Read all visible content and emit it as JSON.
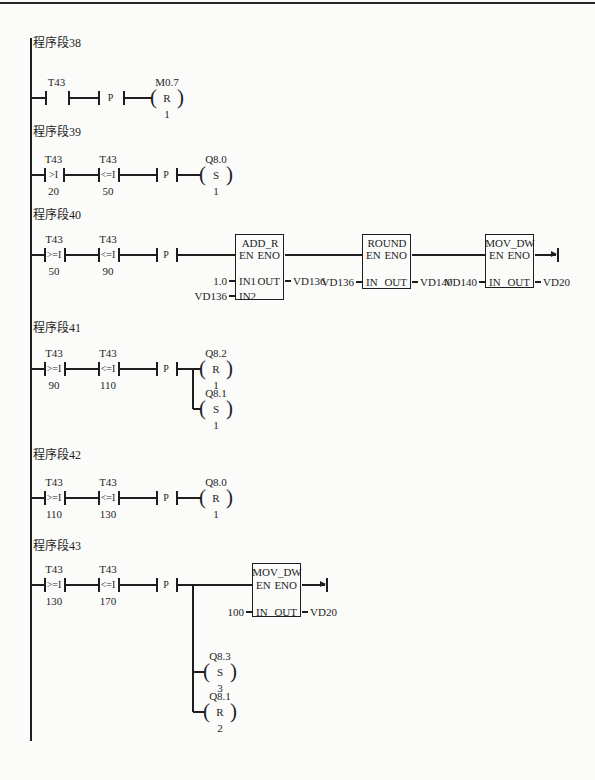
{
  "page": {
    "background": "#fbfbf9",
    "ink": "#1e1e1e",
    "rail": {
      "x": 30,
      "y1": 38,
      "y2": 741
    },
    "top_rule": true
  },
  "networks": [
    {
      "label": "程序段38",
      "label_top": 37,
      "rung_y": 98,
      "hwires": [
        {
          "x1": 30,
          "x2": 45,
          "y": 98
        },
        {
          "x1": 68,
          "x2": 98,
          "y": 98
        },
        {
          "x1": 123,
          "x2": 152,
          "y": 98
        }
      ],
      "vwires": [],
      "contacts": [
        {
          "x1": 45,
          "x2": 68,
          "y": 98,
          "op": "",
          "label": "T43",
          "value": ""
        },
        {
          "x1": 98,
          "x2": 123,
          "y": 98,
          "op": "P",
          "label": "",
          "value": ""
        }
      ],
      "coils": [
        {
          "cx": 167,
          "y": 98,
          "letter": "R",
          "label": "M0.7",
          "value": "1"
        }
      ],
      "boxes": [],
      "endbars": []
    },
    {
      "label": "程序段39",
      "label_top": 126,
      "rung_y": 175,
      "hwires": [
        {
          "x1": 30,
          "x2": 44,
          "y": 175
        },
        {
          "x1": 63,
          "x2": 98,
          "y": 175
        },
        {
          "x1": 118,
          "x2": 156,
          "y": 175
        },
        {
          "x1": 176,
          "x2": 201,
          "y": 175
        }
      ],
      "vwires": [],
      "contacts": [
        {
          "x1": 44,
          "x2": 63,
          "y": 175,
          "op": ">I",
          "label": "T43",
          "value": "20"
        },
        {
          "x1": 98,
          "x2": 118,
          "y": 175,
          "op": "<=I",
          "label": "T43",
          "value": "50"
        },
        {
          "x1": 156,
          "x2": 176,
          "y": 175,
          "op": "P",
          "label": "",
          "value": ""
        }
      ],
      "coils": [
        {
          "cx": 216,
          "y": 175,
          "letter": "S",
          "label": "Q8.0",
          "value": "1"
        }
      ],
      "boxes": [],
      "endbars": []
    },
    {
      "label": "程序段40",
      "label_top": 209,
      "rung_y": 255,
      "hwires": [
        {
          "x1": 30,
          "x2": 44,
          "y": 255
        },
        {
          "x1": 64,
          "x2": 98,
          "y": 255
        },
        {
          "x1": 118,
          "x2": 156,
          "y": 255
        },
        {
          "x1": 176,
          "x2": 235,
          "y": 255
        },
        {
          "x1": 285,
          "x2": 362,
          "y": 255
        },
        {
          "x1": 412,
          "x2": 485,
          "y": 255
        },
        {
          "x1": 535,
          "x2": 556,
          "y": 255
        }
      ],
      "vwires": [],
      "contacts": [
        {
          "x1": 44,
          "x2": 64,
          "y": 255,
          "op": ">=I",
          "label": "T43",
          "value": "50"
        },
        {
          "x1": 98,
          "x2": 118,
          "y": 255,
          "op": "<=I",
          "label": "T43",
          "value": "90"
        },
        {
          "x1": 156,
          "x2": 176,
          "y": 255,
          "op": "P",
          "label": "",
          "value": ""
        }
      ],
      "coils": [],
      "boxes": [
        {
          "title": "ADD_R",
          "x": 235,
          "w": 50,
          "top": 234,
          "h": 67,
          "pins": [
            {
              "name": "EN",
              "side": "l",
              "y": 255,
              "ext": ""
            },
            {
              "name": "ENO",
              "side": "r",
              "y": 255,
              "ext": ""
            },
            {
              "name": "IN1",
              "side": "l",
              "y": 281,
              "ext": "1.0"
            },
            {
              "name": "OUT",
              "side": "r",
              "y": 281,
              "ext": "VD136"
            },
            {
              "name": "IN2",
              "side": "l",
              "y": 296,
              "ext": "VD136"
            }
          ]
        },
        {
          "title": "ROUND",
          "x": 362,
          "w": 50,
          "top": 234,
          "h": 56,
          "pins": [
            {
              "name": "EN",
              "side": "l",
              "y": 255,
              "ext": ""
            },
            {
              "name": "ENO",
              "side": "r",
              "y": 255,
              "ext": ""
            },
            {
              "name": "IN",
              "side": "l",
              "y": 282,
              "ext": "VD136"
            },
            {
              "name": "OUT",
              "side": "r",
              "y": 282,
              "ext": "VD140"
            }
          ]
        },
        {
          "title": "MOV_DW",
          "x": 485,
          "w": 50,
          "top": 234,
          "h": 55,
          "pins": [
            {
              "name": "EN",
              "side": "l",
              "y": 255,
              "ext": ""
            },
            {
              "name": "ENO",
              "side": "r",
              "y": 255,
              "ext": ""
            },
            {
              "name": "IN",
              "side": "l",
              "y": 282,
              "ext": "VD140"
            },
            {
              "name": "OUT",
              "side": "r",
              "y": 282,
              "ext": "VD20"
            }
          ]
        }
      ],
      "endbars": [
        {
          "x": 557,
          "y": 255
        }
      ]
    },
    {
      "label": "程序段41",
      "label_top": 322,
      "rung_y": 369,
      "hwires": [
        {
          "x1": 30,
          "x2": 44,
          "y": 369
        },
        {
          "x1": 64,
          "x2": 98,
          "y": 369
        },
        {
          "x1": 118,
          "x2": 156,
          "y": 369
        },
        {
          "x1": 176,
          "x2": 201,
          "y": 369
        },
        {
          "x1": 193,
          "x2": 201,
          "y": 409
        }
      ],
      "vwires": [
        {
          "x": 193,
          "y1": 369,
          "y2": 409
        }
      ],
      "contacts": [
        {
          "x1": 44,
          "x2": 64,
          "y": 369,
          "op": ">=I",
          "label": "T43",
          "value": "90"
        },
        {
          "x1": 98,
          "x2": 118,
          "y": 369,
          "op": "<=I",
          "label": "T43",
          "value": "110"
        },
        {
          "x1": 156,
          "x2": 176,
          "y": 369,
          "op": "P",
          "label": "",
          "value": ""
        }
      ],
      "coils": [
        {
          "cx": 216,
          "y": 369,
          "letter": "R",
          "label": "Q8.2",
          "value": "1"
        },
        {
          "cx": 216,
          "y": 409,
          "letter": "S",
          "label": "Q8.1",
          "value": "1"
        }
      ],
      "boxes": [],
      "endbars": []
    },
    {
      "label": "程序段42",
      "label_top": 449,
      "rung_y": 498,
      "hwires": [
        {
          "x1": 30,
          "x2": 44,
          "y": 498
        },
        {
          "x1": 64,
          "x2": 98,
          "y": 498
        },
        {
          "x1": 118,
          "x2": 156,
          "y": 498
        },
        {
          "x1": 176,
          "x2": 201,
          "y": 498
        }
      ],
      "vwires": [],
      "contacts": [
        {
          "x1": 44,
          "x2": 64,
          "y": 498,
          "op": ">=I",
          "label": "T43",
          "value": "110"
        },
        {
          "x1": 98,
          "x2": 118,
          "y": 498,
          "op": "<=I",
          "label": "T43",
          "value": "130"
        },
        {
          "x1": 156,
          "x2": 176,
          "y": 498,
          "op": "P",
          "label": "",
          "value": ""
        }
      ],
      "coils": [
        {
          "cx": 216,
          "y": 498,
          "letter": "R",
          "label": "Q8.0",
          "value": "1"
        }
      ],
      "boxes": [],
      "endbars": []
    },
    {
      "label": "程序段43",
      "label_top": 540,
      "rung_y": 585,
      "hwires": [
        {
          "x1": 30,
          "x2": 44,
          "y": 585
        },
        {
          "x1": 64,
          "x2": 98,
          "y": 585
        },
        {
          "x1": 118,
          "x2": 156,
          "y": 585
        },
        {
          "x1": 176,
          "x2": 252,
          "y": 585
        },
        {
          "x1": 302,
          "x2": 325,
          "y": 585
        },
        {
          "x1": 193,
          "x2": 205,
          "y": 672
        },
        {
          "x1": 193,
          "x2": 205,
          "y": 712
        }
      ],
      "vwires": [
        {
          "x": 193,
          "y1": 585,
          "y2": 712
        }
      ],
      "contacts": [
        {
          "x1": 44,
          "x2": 64,
          "y": 585,
          "op": ">=I",
          "label": "T43",
          "value": "130"
        },
        {
          "x1": 98,
          "x2": 118,
          "y": 585,
          "op": "<=I",
          "label": "T43",
          "value": "170"
        },
        {
          "x1": 156,
          "x2": 176,
          "y": 585,
          "op": "P",
          "label": "",
          "value": ""
        }
      ],
      "coils": [
        {
          "cx": 220,
          "y": 672,
          "letter": "S",
          "label": "Q8.3",
          "value": "3"
        },
        {
          "cx": 220,
          "y": 712,
          "letter": "R",
          "label": "Q8.1",
          "value": "2"
        }
      ],
      "boxes": [
        {
          "title": "MOV_DW",
          "x": 252,
          "w": 50,
          "top": 563,
          "h": 55,
          "pins": [
            {
              "name": "EN",
              "side": "l",
              "y": 585,
              "ext": ""
            },
            {
              "name": "ENO",
              "side": "r",
              "y": 585,
              "ext": ""
            },
            {
              "name": "IN",
              "side": "l",
              "y": 612,
              "ext": "100"
            },
            {
              "name": "OUT",
              "side": "r",
              "y": 612,
              "ext": "VD20"
            }
          ]
        }
      ],
      "endbars": [
        {
          "x": 326,
          "y": 585
        }
      ]
    }
  ]
}
